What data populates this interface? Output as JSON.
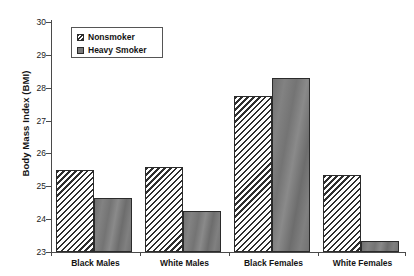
{
  "chart_data": {
    "type": "bar",
    "title": "",
    "xlabel": "",
    "ylabel": "Body Mass Index (BMI)",
    "categories": [
      "Black Males",
      "White Males",
      "Black Females",
      "White Females"
    ],
    "series": [
      {
        "name": "Nonsmoker",
        "values": [
          25.5,
          25.6,
          27.75,
          25.35
        ]
      },
      {
        "name": "Heavy Smoker",
        "values": [
          24.63,
          24.25,
          28.3,
          23.35
        ]
      }
    ],
    "ylim": [
      23,
      30
    ],
    "ytick_labels": [
      "30",
      "29",
      "28",
      "27",
      "26",
      "25",
      "24",
      "23"
    ],
    "ytick_values": [
      30,
      29,
      28,
      27,
      26,
      25,
      24,
      23
    ],
    "grid": false,
    "legend_position": "upper-left-inside",
    "colors": {
      "nonsmoker_hatch": "#2f2f2f",
      "nonsmoker_background": "#ffffff",
      "heavy_smoker_fill": "#7a7a7a",
      "bar_outline": "#2b2b2b",
      "axis": "#4a4a4a",
      "text": "#141414"
    }
  },
  "legend": {
    "items": [
      {
        "label": "Nonsmoker",
        "swatch": "hatched-swatch"
      },
      {
        "label": "Heavy Smoker",
        "swatch": "solid-gray-swatch"
      }
    ]
  }
}
